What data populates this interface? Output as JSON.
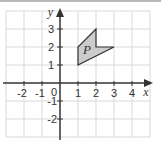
{
  "figure": {
    "x_axis_label": "x",
    "y_axis_label": "y",
    "origin_label": "0",
    "x_tick_labels": [
      "-2",
      "-1",
      "1",
      "2",
      "3",
      "4"
    ],
    "y_tick_labels": [
      "3",
      "2",
      "1",
      "-1",
      "-2"
    ],
    "shape_label": "P",
    "shape_vertices": [
      [
        1,
        1
      ],
      [
        1,
        2
      ],
      [
        2,
        3
      ],
      [
        2,
        2
      ],
      [
        3,
        2
      ]
    ],
    "x_range": [
      -3,
      5
    ],
    "y_range": [
      -3,
      4
    ],
    "colors": {
      "grid": "#d9d9d9",
      "axis": "#333333",
      "shape_fill": "#cccccc",
      "shape_stroke": "#333333"
    }
  }
}
